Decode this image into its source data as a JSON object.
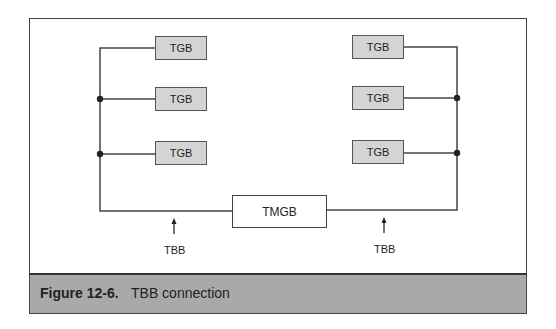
{
  "figure": {
    "number": "Figure 12-6.",
    "title": "TBB connection"
  },
  "diagram": {
    "left_group": [
      {
        "label": "TGB"
      },
      {
        "label": "TGB"
      },
      {
        "label": "TGB"
      }
    ],
    "right_group": [
      {
        "label": "TGB"
      },
      {
        "label": "TGB"
      },
      {
        "label": "TGB"
      }
    ],
    "main_bar": {
      "label": "TMGB"
    },
    "arrows": [
      {
        "label": "TBB"
      },
      {
        "label": "TBB"
      }
    ]
  },
  "colors": {
    "tgb_fill": "#d4d4d4",
    "caption_band": "#a9a9a9",
    "line": "#444444"
  }
}
